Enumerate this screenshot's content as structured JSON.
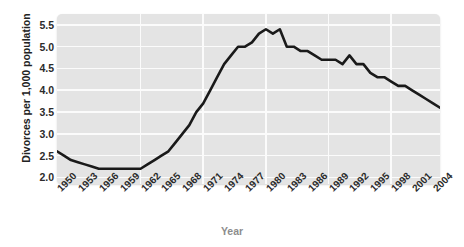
{
  "chart_data": {
    "type": "line",
    "title": "",
    "xlabel": "Year",
    "ylabel": "Divorces per 1,000 population",
    "xlim": [
      1950,
      2005
    ],
    "ylim": [
      1.85,
      5.75
    ],
    "grid": true,
    "legend": false,
    "line_color": "#1a1a1a",
    "panel_color": "#e4e4e4",
    "gridline_color": "#fbfbfb",
    "yticks": [
      "2.0",
      "2.5",
      "3.0",
      "3.5",
      "4.0",
      "4.5",
      "5.0",
      "5.5"
    ],
    "ytick_values": [
      2.0,
      2.5,
      3.0,
      3.5,
      4.0,
      4.5,
      5.0,
      5.5
    ],
    "xticks": [
      "1950",
      "1953",
      "1956",
      "1959",
      "1962",
      "1965",
      "1968",
      "1971",
      "1974",
      "1977",
      "1980",
      "1983",
      "1986",
      "1989",
      "1992",
      "1995",
      "1998",
      "2001",
      "2004"
    ],
    "xtick_values": [
      1950,
      1953,
      1956,
      1959,
      1962,
      1965,
      1968,
      1971,
      1974,
      1977,
      1980,
      1983,
      1986,
      1989,
      1992,
      1995,
      1998,
      2001,
      2004
    ],
    "x": [
      1950,
      1951,
      1952,
      1953,
      1954,
      1955,
      1956,
      1957,
      1958,
      1959,
      1960,
      1961,
      1962,
      1963,
      1964,
      1965,
      1966,
      1967,
      1968,
      1969,
      1970,
      1971,
      1972,
      1973,
      1974,
      1975,
      1976,
      1977,
      1978,
      1979,
      1980,
      1981,
      1982,
      1983,
      1984,
      1985,
      1986,
      1987,
      1988,
      1989,
      1990,
      1991,
      1992,
      1993,
      1994,
      1995,
      1996,
      1997,
      1998,
      1999,
      2000,
      2001,
      2002,
      2003,
      2004,
      2005
    ],
    "values": [
      2.6,
      2.5,
      2.4,
      2.35,
      2.3,
      2.25,
      2.2,
      2.2,
      2.2,
      2.2,
      2.2,
      2.2,
      2.2,
      2.3,
      2.4,
      2.5,
      2.6,
      2.8,
      3.0,
      3.2,
      3.5,
      3.7,
      4.0,
      4.3,
      4.6,
      4.8,
      5.0,
      5.0,
      5.1,
      5.3,
      5.4,
      5.3,
      5.4,
      5.0,
      5.0,
      4.9,
      4.9,
      4.8,
      4.7,
      4.7,
      4.7,
      4.6,
      4.8,
      4.6,
      4.6,
      4.4,
      4.3,
      4.3,
      4.2,
      4.1,
      4.1,
      4.0,
      3.9,
      3.8,
      3.7,
      3.6
    ],
    "series": [
      {
        "name": "Divorce rate",
        "values": [
          2.6,
          2.5,
          2.4,
          2.35,
          2.3,
          2.25,
          2.2,
          2.2,
          2.2,
          2.2,
          2.2,
          2.2,
          2.2,
          2.3,
          2.4,
          2.5,
          2.6,
          2.8,
          3.0,
          3.2,
          3.5,
          3.7,
          4.0,
          4.3,
          4.6,
          4.8,
          5.0,
          5.0,
          5.1,
          5.3,
          5.4,
          5.3,
          5.4,
          5.0,
          5.0,
          4.9,
          4.9,
          4.8,
          4.7,
          4.7,
          4.7,
          4.6,
          4.8,
          4.6,
          4.6,
          4.4,
          4.3,
          4.3,
          4.2,
          4.1,
          4.1,
          4.0,
          3.9,
          3.8,
          3.7,
          3.6
        ]
      }
    ]
  }
}
